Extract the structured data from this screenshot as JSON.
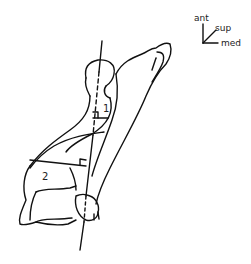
{
  "diagram": {
    "orientation": {
      "axis_labels": [
        "ant",
        "sup",
        "med"
      ]
    },
    "measurements": [
      {
        "label": "1"
      },
      {
        "label": "2"
      }
    ]
  }
}
